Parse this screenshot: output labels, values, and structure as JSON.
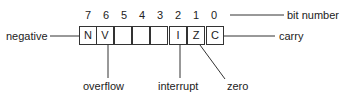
{
  "diagram": {
    "type": "register-bit-layout",
    "bit_numbers": [
      "7",
      "6",
      "5",
      "4",
      "3",
      "2",
      "1",
      "0"
    ],
    "bit_number_label": "bit number",
    "cells": [
      "N",
      "V",
      "",
      "",
      "",
      "I",
      "Z",
      "C"
    ],
    "labels": {
      "negative": "negative",
      "carry": "carry",
      "overflow": "overflow",
      "interrupt": "interrupt",
      "zero": "zero"
    },
    "line_color": "#333333"
  }
}
